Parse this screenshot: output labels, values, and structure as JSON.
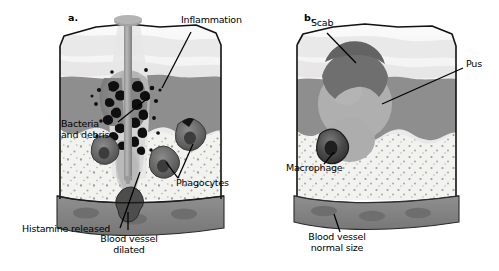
{
  "figure": {
    "title_visible": false,
    "background": "#ffffff",
    "panels": [
      {
        "key": "a.",
        "name": "acute-inflammation-panel",
        "labels": [
          {
            "id": "inflammation",
            "text": "Inflammation",
            "x": 181,
            "y": 20,
            "align": "left"
          },
          {
            "id": "bacteria-and-debris",
            "text": "Bacteria\nand debris",
            "x": 62,
            "y": 124,
            "align": "left"
          },
          {
            "id": "phagocytes",
            "text": "Phagocytes",
            "x": 177,
            "y": 182,
            "align": "left"
          },
          {
            "id": "histamine-released",
            "text": "Histamine released",
            "x": 24,
            "y": 228,
            "align": "left"
          },
          {
            "id": "blood-vessel-dilated",
            "text": "Blood vessel\ndilated",
            "x": 128,
            "y": 238,
            "align": "center"
          }
        ]
      },
      {
        "key": "b.",
        "name": "scab-pus-panel",
        "labels": [
          {
            "id": "scab",
            "text": "Scab",
            "x": 311,
            "y": 22,
            "align": "left"
          },
          {
            "id": "pus",
            "text": "Pus",
            "x": 466,
            "y": 63,
            "align": "left"
          },
          {
            "id": "macrophage",
            "text": "Macrophage",
            "x": 288,
            "y": 167,
            "align": "left"
          },
          {
            "id": "blood-vessel-normal-size",
            "text": "Blood vessel\nnormal size",
            "x": 336,
            "y": 236,
            "align": "center"
          }
        ]
      }
    ],
    "colors": {
      "outline": "#1a1a1a",
      "epidermis": "#efefef",
      "epidermis_shadow": "#d9d9d9",
      "dermis": "#8d8d8d",
      "hypodermis": "#f1f1ee",
      "speckle": "#9a9a9a",
      "blood_vessel": "#8a8a8a",
      "vessel_cell": "#6f6f6f",
      "phagocyte_outer": "#6b6b6b",
      "phagocyte_inner": "#3f3f3f",
      "bacteria": "#111111",
      "nail": "#9c9c9c",
      "scab": "#6d6d6d",
      "pus": "#adadad",
      "label_text": "#000000"
    },
    "elements": {
      "nail": "nail-piercing-skin",
      "scab": "scab-dome",
      "pus": "pus-pocket",
      "macrophage": "macrophage-cell",
      "phagocytes": "phagocyte-cells",
      "bacteria": "bacteria-rods",
      "blood_vessel_dilated": "dilated-blood-vessel",
      "blood_vessel_normal": "normal-blood-vessel"
    }
  }
}
